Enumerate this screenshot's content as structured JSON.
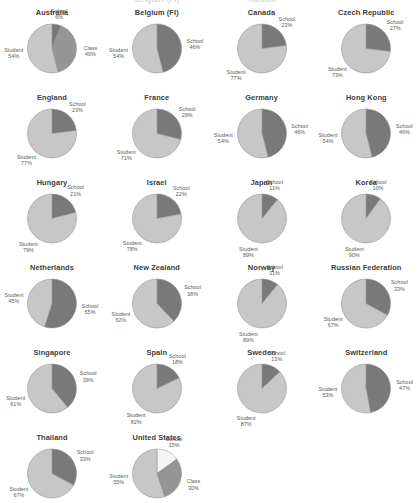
{
  "figure": {
    "type": "pie-grid",
    "columns": 4,
    "chart_count": 21,
    "series_names": [
      "School",
      "Class",
      "Student"
    ],
    "colors": {
      "school": "#6e6e6e",
      "class": "#8f8f8f",
      "student": "#c9c9c9",
      "white_slice": "#ffffff",
      "outline": "#8a8a8a",
      "text": "#5a5a5a",
      "title": "#3d3d3d",
      "background": "#ffffff"
    },
    "cut_off_top_row": [
      "Belgium (Fl)",
      "Canada"
    ]
  },
  "chart_data": [
    {
      "type": "pie",
      "title": "Australia",
      "labels": [
        "School",
        "Class",
        "Student"
      ],
      "values": [
        6,
        40,
        54
      ],
      "value_labels": [
        "6%",
        "40%",
        "54%"
      ],
      "row": 0,
      "col": 0
    },
    {
      "type": "pie",
      "title": "Belgium (Fl)",
      "labels": [
        "School",
        "Student"
      ],
      "values": [
        46,
        54
      ],
      "value_labels": [
        "46%",
        "54%"
      ],
      "row": 0,
      "col": 1
    },
    {
      "type": "pie",
      "title": "Canada",
      "labels": [
        "School",
        "Student"
      ],
      "values": [
        23,
        77
      ],
      "value_labels": [
        "23%",
        "77%"
      ],
      "row": 0,
      "col": 2
    },
    {
      "type": "pie",
      "title": "Czech Republic",
      "labels": [
        "School",
        "Student"
      ],
      "values": [
        27,
        73
      ],
      "value_labels": [
        "27%",
        "73%"
      ],
      "row": 0,
      "col": 3
    },
    {
      "type": "pie",
      "title": "England",
      "labels": [
        "School",
        "Student"
      ],
      "values": [
        23,
        77
      ],
      "value_labels": [
        "23%",
        "77%"
      ],
      "row": 1,
      "col": 0
    },
    {
      "type": "pie",
      "title": "France",
      "labels": [
        "School",
        "Student"
      ],
      "values": [
        29,
        71
      ],
      "value_labels": [
        "29%",
        "71%"
      ],
      "row": 1,
      "col": 1
    },
    {
      "type": "pie",
      "title": "Germany",
      "labels": [
        "School",
        "Student"
      ],
      "values": [
        46,
        54
      ],
      "value_labels": [
        "46%",
        "54%"
      ],
      "row": 1,
      "col": 2
    },
    {
      "type": "pie",
      "title": "Hong Kong",
      "labels": [
        "School",
        "Student"
      ],
      "values": [
        46,
        54
      ],
      "value_labels": [
        "46%",
        "54%"
      ],
      "row": 1,
      "col": 3
    },
    {
      "type": "pie",
      "title": "Hungary",
      "labels": [
        "School",
        "Student"
      ],
      "values": [
        21,
        79
      ],
      "value_labels": [
        "21%",
        "79%"
      ],
      "row": 2,
      "col": 0
    },
    {
      "type": "pie",
      "title": "Israel",
      "labels": [
        "School",
        "Student"
      ],
      "values": [
        22,
        78
      ],
      "value_labels": [
        "22%",
        "78%"
      ],
      "row": 2,
      "col": 1
    },
    {
      "type": "pie",
      "title": "Japan",
      "labels": [
        "School",
        "Student"
      ],
      "values": [
        11,
        89
      ],
      "value_labels": [
        "11%",
        "89%"
      ],
      "row": 2,
      "col": 2
    },
    {
      "type": "pie",
      "title": "Korea",
      "labels": [
        "School",
        "Student"
      ],
      "values": [
        10,
        90
      ],
      "value_labels": [
        "10%",
        "90%"
      ],
      "row": 2,
      "col": 3
    },
    {
      "type": "pie",
      "title": "Netherlands",
      "labels": [
        "School",
        "Student"
      ],
      "values": [
        55,
        45
      ],
      "value_labels": [
        "55%",
        "45%"
      ],
      "row": 3,
      "col": 0
    },
    {
      "type": "pie",
      "title": "New Zealand",
      "labels": [
        "School",
        "Student"
      ],
      "values": [
        38,
        62
      ],
      "value_labels": [
        "38%",
        "62%"
      ],
      "row": 3,
      "col": 1
    },
    {
      "type": "pie",
      "title": "Norway",
      "labels": [
        "School",
        "Student"
      ],
      "values": [
        11,
        89
      ],
      "value_labels": [
        "11%",
        "89%"
      ],
      "row": 3,
      "col": 2
    },
    {
      "type": "pie",
      "title": "Russian Federation",
      "labels": [
        "School",
        "Student"
      ],
      "values": [
        33,
        67
      ],
      "value_labels": [
        "33%",
        "67%"
      ],
      "row": 3,
      "col": 3
    },
    {
      "type": "pie",
      "title": "Singapore",
      "labels": [
        "School",
        "Student"
      ],
      "values": [
        39,
        61
      ],
      "value_labels": [
        "39%",
        "61%"
      ],
      "row": 4,
      "col": 0
    },
    {
      "type": "pie",
      "title": "Spain",
      "labels": [
        "School",
        "Student"
      ],
      "values": [
        18,
        82
      ],
      "value_labels": [
        "18%",
        "82%"
      ],
      "row": 4,
      "col": 1
    },
    {
      "type": "pie",
      "title": "Sweden",
      "labels": [
        "School",
        "Student"
      ],
      "values": [
        13,
        87
      ],
      "value_labels": [
        "13%",
        "87%"
      ],
      "row": 4,
      "col": 2
    },
    {
      "type": "pie",
      "title": "Switzerland",
      "labels": [
        "School",
        "Student"
      ],
      "values": [
        47,
        53
      ],
      "value_labels": [
        "47%",
        "53%"
      ],
      "row": 4,
      "col": 3
    },
    {
      "type": "pie",
      "title": "Thailand",
      "labels": [
        "School",
        "Student"
      ],
      "values": [
        33,
        67
      ],
      "value_labels": [
        "33%",
        "67%"
      ],
      "row": 5,
      "col": 0
    },
    {
      "type": "pie",
      "title": "United States",
      "labels": [
        "School",
        "Class",
        "Student"
      ],
      "values": [
        15,
        30,
        55
      ],
      "value_labels": [
        "15%",
        "30%",
        "55%"
      ],
      "row": 5,
      "col": 1
    }
  ]
}
